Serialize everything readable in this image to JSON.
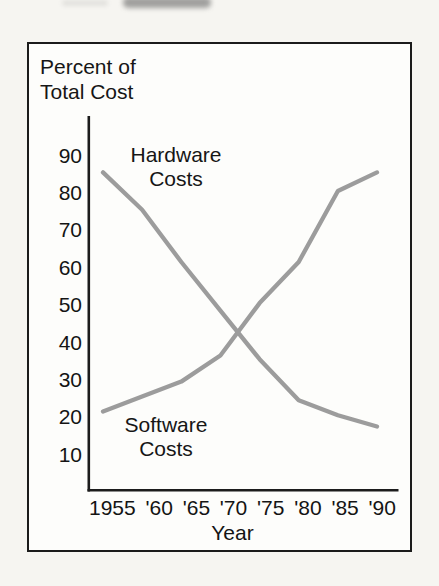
{
  "chart_data": {
    "type": "line",
    "y_axis_title": {
      "line1": "Percent of",
      "line2": "Total Cost"
    },
    "xlabel": "Year",
    "ylabel": "Percent of Total Cost",
    "x_tick_labels": [
      "1955",
      "'60",
      "'65",
      "'70",
      "'75",
      "'80",
      "'85",
      "'90"
    ],
    "x_values": [
      1955,
      1960,
      1965,
      1970,
      1975,
      1980,
      1985,
      1990
    ],
    "y_tick_labels": [
      90,
      80,
      70,
      60,
      50,
      40,
      30,
      20,
      10
    ],
    "ylim": [
      0,
      100
    ],
    "grid": false,
    "legend": "inline-annotations",
    "series": [
      {
        "name": "Hardware Costs",
        "annotation": {
          "line1": "Hardware",
          "line2": "Costs"
        },
        "color": "#9c9c9c",
        "values": [
          85,
          75,
          61,
          48,
          35,
          24,
          20,
          17
        ]
      },
      {
        "name": "Software Costs",
        "annotation": {
          "line1": "Software",
          "line2": "Costs"
        },
        "color": "#9c9c9c",
        "values": [
          21,
          25,
          29,
          36,
          50,
          61,
          80,
          85
        ]
      }
    ]
  },
  "colors": {
    "line_gray": "#9c9c9c",
    "ink": "#1a1a1a",
    "page_background": "#f6f5f1",
    "box_background": "#fdfdfb"
  }
}
